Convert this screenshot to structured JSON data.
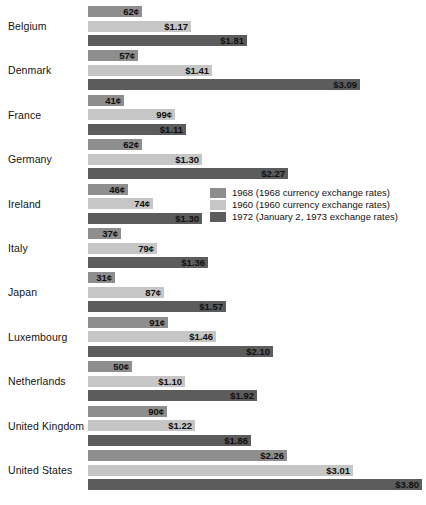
{
  "chart_data": {
    "type": "bar",
    "orientation": "horizontal",
    "title": "",
    "xlabel": "",
    "ylabel": "",
    "grid": false,
    "legend_position": "middle-right",
    "xlim": [
      0,
      3.8
    ],
    "value_unit": "US dollars per hour",
    "categories": [
      "Belgium",
      "Denmark",
      "France",
      "Germany",
      "Ireland",
      "Italy",
      "Japan",
      "Luxembourg",
      "Netherlands",
      "United Kingdom",
      "United States"
    ],
    "series": [
      {
        "name": "1968 (1968 currency exchange rates)",
        "color": "#8e8e8e",
        "values": [
          0.62,
          0.57,
          0.41,
          0.62,
          0.46,
          0.37,
          0.31,
          0.91,
          0.5,
          0.9,
          2.26
        ],
        "labels": [
          "62¢",
          "57¢",
          "41¢",
          "62¢",
          "46¢",
          "37¢",
          "31¢",
          "91¢",
          "50¢",
          "90¢",
          "$2.26"
        ]
      },
      {
        "name": "1960 (1960 currency exchange rates)",
        "color": "#c6c6c6",
        "values": [
          1.17,
          1.41,
          0.99,
          1.3,
          0.74,
          0.79,
          0.87,
          1.46,
          1.1,
          1.22,
          3.01
        ],
        "labels": [
          "$1.17",
          "$1.41",
          "99¢",
          "$1.30",
          "74¢",
          "79¢",
          "87¢",
          "$1.46",
          "$1.10",
          "$1.22",
          "$3.01"
        ]
      },
      {
        "name": "1972 (January 2, 1973 exchange rates)",
        "color": "#5c5c5c",
        "values": [
          1.81,
          3.09,
          1.11,
          2.27,
          1.3,
          1.36,
          1.57,
          2.1,
          1.92,
          1.86,
          3.8
        ],
        "labels": [
          "$1.81",
          "$3.09",
          "$1.11",
          "$2.27",
          "$1.30",
          "$1.36",
          "$1.57",
          "$2.10",
          "$1.92",
          "$1.86",
          "$3.80"
        ]
      }
    ]
  },
  "legend": {
    "items": [
      {
        "label": "1968 (1968 currency exchange rates)"
      },
      {
        "label": "1960 (1960 currency exchange rates)"
      },
      {
        "label": "1972 (January 2, 1973 exchange rates)"
      }
    ]
  },
  "footnote": {
    "text": ""
  }
}
